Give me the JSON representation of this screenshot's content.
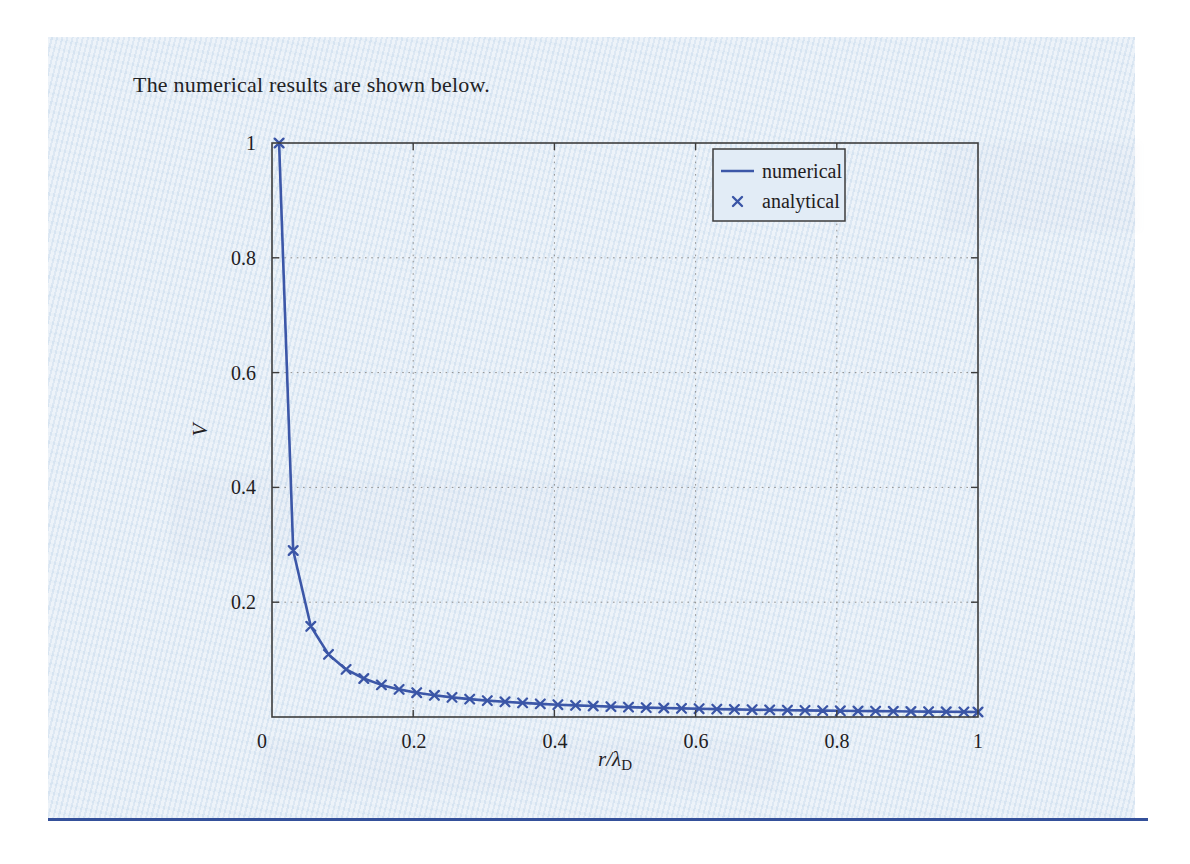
{
  "page": {
    "heading": "The numerical results are shown below.",
    "background_color": "#e2ecf6",
    "bottom_rule_color": "#34509a"
  },
  "chart_data": {
    "type": "line",
    "title": "",
    "xlabel": "r/λ_D",
    "xlabel_parts": {
      "main": "r/λ",
      "sub": "D"
    },
    "ylabel": "V",
    "xlim": [
      0,
      1
    ],
    "ylim": [
      0,
      1
    ],
    "xticks": [
      "0",
      "0.2",
      "0.4",
      "0.6",
      "0.8",
      "1"
    ],
    "yticks": [
      "1",
      "0.8",
      "0.6",
      "0.4",
      "0.2"
    ],
    "grid": "dotted",
    "legend": {
      "position": "top-right",
      "entries": [
        {
          "label": "numerical",
          "style": "solid-line"
        },
        {
          "label": "analytical",
          "style": "x-marker"
        }
      ]
    },
    "colors": {
      "line": "#3c57a8",
      "marker": "#3a55a6",
      "frame": "#3d3d3d",
      "grid": "#909090"
    },
    "x": [
      0.01,
      0.03,
      0.055,
      0.08,
      0.105,
      0.13,
      0.155,
      0.18,
      0.205,
      0.23,
      0.255,
      0.28,
      0.305,
      0.33,
      0.355,
      0.38,
      0.405,
      0.43,
      0.455,
      0.48,
      0.505,
      0.53,
      0.555,
      0.58,
      0.605,
      0.63,
      0.655,
      0.68,
      0.705,
      0.73,
      0.755,
      0.78,
      0.805,
      0.83,
      0.855,
      0.88,
      0.905,
      0.93,
      0.955,
      0.98,
      1.0
    ],
    "series": [
      {
        "name": "numerical",
        "type": "line",
        "values": [
          1.0,
          0.29,
          0.158,
          0.109,
          0.083,
          0.067,
          0.056,
          0.048,
          0.0424,
          0.0378,
          0.0341,
          0.0311,
          0.0285,
          0.0264,
          0.0245,
          0.0229,
          0.0215,
          0.0202,
          0.0191,
          0.0181,
          0.0172,
          0.0164,
          0.0157,
          0.015,
          0.0144,
          0.0138,
          0.0133,
          0.0128,
          0.0123,
          0.0119,
          0.0115,
          0.0112,
          0.0108,
          0.0105,
          0.0102,
          0.0099,
          0.0096,
          0.0094,
          0.0091,
          0.0089,
          0.0087
        ]
      },
      {
        "name": "analytical",
        "type": "scatter",
        "values": [
          1.0,
          0.29,
          0.158,
          0.109,
          0.083,
          0.067,
          0.056,
          0.048,
          0.0424,
          0.0378,
          0.0341,
          0.0311,
          0.0285,
          0.0264,
          0.0245,
          0.0229,
          0.0215,
          0.0202,
          0.0191,
          0.0181,
          0.0172,
          0.0164,
          0.0157,
          0.015,
          0.0144,
          0.0138,
          0.0133,
          0.0128,
          0.0123,
          0.0119,
          0.0115,
          0.0112,
          0.0108,
          0.0105,
          0.0102,
          0.0099,
          0.0096,
          0.0094,
          0.0091,
          0.0089,
          0.0087
        ]
      }
    ]
  }
}
